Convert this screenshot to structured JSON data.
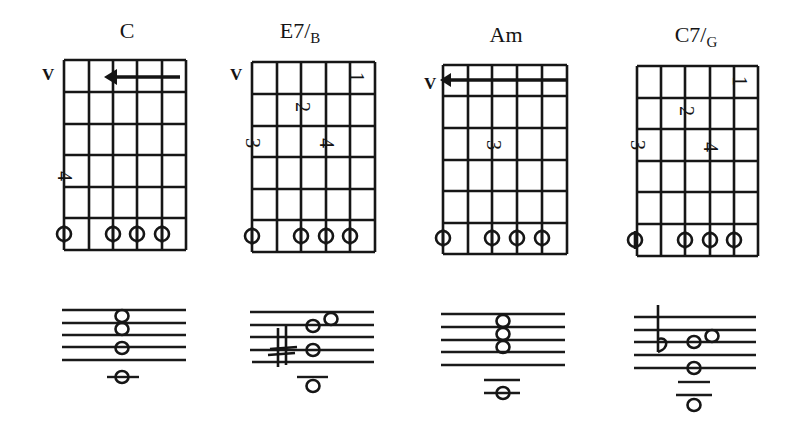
{
  "chords": [
    {
      "name": "C",
      "bass": "",
      "position_label": "V",
      "fingerings": [
        {
          "finger": "4",
          "string": 1,
          "fret": 4
        },
        {
          "type": "barre-arrow",
          "from_string": 5,
          "to_string": 3,
          "fret": 1
        }
      ],
      "open_strings": [
        1,
        3,
        4,
        5
      ],
      "staff_notes": [
        "high E on staff",
        "C",
        "A",
        "G",
        "low C ledger"
      ]
    },
    {
      "name": "E7",
      "bass": "B",
      "position_label": "V",
      "fingerings": [
        {
          "finger": "1",
          "string": 5,
          "fret": 1
        },
        {
          "finger": "2",
          "string": 3,
          "fret": 2
        },
        {
          "finger": "3",
          "string": 1,
          "fret": 3
        },
        {
          "finger": "4",
          "string": 4,
          "fret": 3
        }
      ],
      "open_strings": [
        1,
        3,
        4,
        5
      ],
      "accidental": "sharp"
    },
    {
      "name": "Am",
      "bass": "",
      "position_label": "V",
      "fingerings": [
        {
          "type": "barre-arrow",
          "from_string": 6,
          "to_string": 1,
          "fret": 1
        },
        {
          "finger": "3",
          "string": 3,
          "fret": 3
        }
      ],
      "open_strings": [
        1,
        3,
        4,
        5
      ]
    },
    {
      "name": "C7",
      "bass": "G",
      "position_label": "",
      "fingerings": [
        {
          "finger": "1",
          "string": 5,
          "fret": 1
        },
        {
          "finger": "2",
          "string": 3,
          "fret": 2
        },
        {
          "finger": "3",
          "string": 1,
          "fret": 3
        },
        {
          "finger": "4",
          "string": 4,
          "fret": 3
        }
      ],
      "open_strings": [
        1,
        3,
        4,
        5
      ],
      "accidental": "flat"
    }
  ]
}
